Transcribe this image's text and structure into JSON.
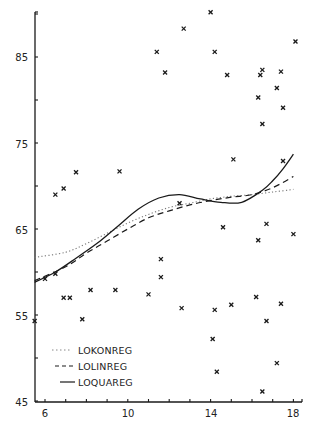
{
  "chart_data": {
    "type": "scatter",
    "title": "",
    "xlabel": "",
    "ylabel": "",
    "xlim": [
      5.5,
      18.4
    ],
    "ylim": [
      45,
      91
    ],
    "x_ticks": [
      6,
      10,
      14,
      18
    ],
    "x_minor_step": 1,
    "y_ticks": [
      45,
      55,
      65,
      75,
      85
    ],
    "y_minor_step": 5,
    "grid": false,
    "legend_position": "lower left",
    "points": [
      {
        "x": 5.5,
        "y": 54.3
      },
      {
        "x": 6.0,
        "y": 59.2
      },
      {
        "x": 6.5,
        "y": 59.8
      },
      {
        "x": 6.5,
        "y": 69.0
      },
      {
        "x": 6.9,
        "y": 69.7
      },
      {
        "x": 6.9,
        "y": 57.0
      },
      {
        "x": 7.2,
        "y": 57.0
      },
      {
        "x": 7.5,
        "y": 71.6
      },
      {
        "x": 7.8,
        "y": 54.5
      },
      {
        "x": 8.2,
        "y": 57.9
      },
      {
        "x": 9.4,
        "y": 57.9
      },
      {
        "x": 9.6,
        "y": 71.7
      },
      {
        "x": 11.0,
        "y": 57.4
      },
      {
        "x": 11.4,
        "y": 85.6
      },
      {
        "x": 11.6,
        "y": 61.5
      },
      {
        "x": 11.6,
        "y": 59.4
      },
      {
        "x": 11.8,
        "y": 83.2
      },
      {
        "x": 12.5,
        "y": 68.0
      },
      {
        "x": 12.7,
        "y": 88.3
      },
      {
        "x": 12.6,
        "y": 55.8
      },
      {
        "x": 14.0,
        "y": 90.2
      },
      {
        "x": 14.2,
        "y": 85.6
      },
      {
        "x": 14.2,
        "y": 55.6
      },
      {
        "x": 14.1,
        "y": 52.2
      },
      {
        "x": 14.3,
        "y": 48.4
      },
      {
        "x": 14.6,
        "y": 65.2
      },
      {
        "x": 14.8,
        "y": 82.9
      },
      {
        "x": 15.0,
        "y": 56.2
      },
      {
        "x": 15.1,
        "y": 73.1
      },
      {
        "x": 16.3,
        "y": 80.3
      },
      {
        "x": 16.3,
        "y": 63.7
      },
      {
        "x": 16.2,
        "y": 57.1
      },
      {
        "x": 16.4,
        "y": 82.9
      },
      {
        "x": 16.5,
        "y": 83.5
      },
      {
        "x": 16.5,
        "y": 77.2
      },
      {
        "x": 16.5,
        "y": 46.1
      },
      {
        "x": 16.7,
        "y": 65.6
      },
      {
        "x": 16.7,
        "y": 54.3
      },
      {
        "x": 17.2,
        "y": 81.4
      },
      {
        "x": 17.2,
        "y": 49.4
      },
      {
        "x": 17.4,
        "y": 83.3
      },
      {
        "x": 17.5,
        "y": 79.1
      },
      {
        "x": 17.5,
        "y": 72.9
      },
      {
        "x": 17.4,
        "y": 56.3
      },
      {
        "x": 18.1,
        "y": 86.8
      },
      {
        "x": 18.0,
        "y": 64.4
      }
    ],
    "series": [
      {
        "name": "LOKONREG",
        "style": "dotted",
        "x": [
          5.5,
          7.0,
          8.0,
          9.0,
          10.0,
          11.0,
          12.0,
          13.0,
          14.0,
          15.0,
          16.0,
          17.0,
          18.0
        ],
        "values": [
          61.7,
          62.3,
          63.3,
          64.5,
          65.7,
          66.7,
          67.5,
          68.0,
          68.5,
          68.8,
          69.0,
          69.3,
          69.6
        ]
      },
      {
        "name": "LOLINREG",
        "style": "dashed",
        "x": [
          5.5,
          7.0,
          8.0,
          9.0,
          10.0,
          11.0,
          12.0,
          13.0,
          14.0,
          15.0,
          16.0,
          17.0,
          18.0
        ],
        "values": [
          59.0,
          60.6,
          62.2,
          63.6,
          65.0,
          66.3,
          67.1,
          67.8,
          68.3,
          68.7,
          69.0,
          69.8,
          71.1
        ]
      },
      {
        "name": "LOQUAREG",
        "style": "solid",
        "x": [
          5.5,
          6.5,
          7.5,
          8.5,
          9.5,
          10.5,
          11.5,
          12.5,
          13.5,
          14.5,
          15.5,
          16.5,
          17.0,
          17.5,
          18.0
        ],
        "values": [
          58.8,
          60.0,
          61.6,
          63.3,
          65.3,
          67.3,
          68.6,
          69.0,
          68.5,
          68.1,
          68.1,
          69.5,
          70.6,
          72.0,
          73.7
        ]
      }
    ],
    "legend": [
      {
        "label": "LOKONREG",
        "style": "dotted"
      },
      {
        "label": "LOLINREG",
        "style": "dashed"
      },
      {
        "label": "LOQUAREG",
        "style": "solid"
      }
    ]
  },
  "axes": {
    "y_tick_labels": [
      "85",
      "75",
      "65",
      "55",
      "45"
    ],
    "x_tick_labels": [
      "6",
      "10",
      "14",
      "18"
    ]
  },
  "legend": {
    "item_1": "LOKONREG",
    "item_2": "LOLINREG",
    "item_3": "LOQUAREG"
  },
  "colors": {
    "ink": "#1a1a1a",
    "background": "#ffffff"
  }
}
